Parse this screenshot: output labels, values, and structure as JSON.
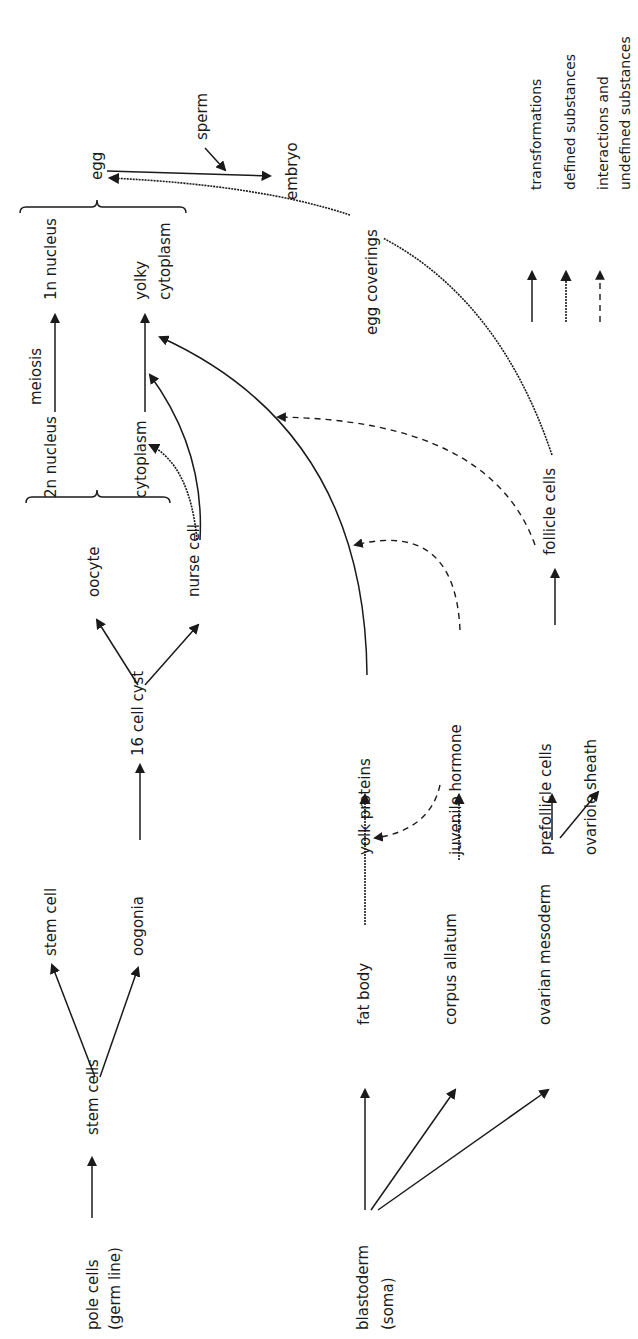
{
  "diagram": {
    "title_orientation": "rotated-90-ccw",
    "colors": {
      "ink": "#1a1a1a",
      "background": "#ffffff"
    },
    "nodes": [
      {
        "id": "pole_cells",
        "label": "pole cells",
        "x": 98,
        "y": 1330
      },
      {
        "id": "germ_line",
        "label": "(germ line)",
        "x": 120,
        "y": 1330
      },
      {
        "id": "stem_cells",
        "label": "stem cells",
        "x": 98,
        "y": 1135
      },
      {
        "id": "stem_cell",
        "label": "stem cell",
        "x": 56,
        "y": 956
      },
      {
        "id": "oogonia",
        "label": "oogonia",
        "x": 143,
        "y": 956
      },
      {
        "id": "cyst16",
        "label": "16 cell cyst",
        "x": 143,
        "y": 756
      },
      {
        "id": "oocyte",
        "label": "oocyte",
        "x": 99,
        "y": 597
      },
      {
        "id": "nurse_cell",
        "label": "nurse cell",
        "x": 199,
        "y": 597
      },
      {
        "id": "n2",
        "label": "2n nucleus",
        "x": 56,
        "y": 498
      },
      {
        "id": "cytoplasm",
        "label": "cytoplasm",
        "x": 146,
        "y": 498
      },
      {
        "id": "meiosis",
        "label": "meiosis",
        "x": 41,
        "y": 405
      },
      {
        "id": "n1",
        "label": "1n nucleus",
        "x": 56,
        "y": 300
      },
      {
        "id": "yolky",
        "label": "yolky",
        "x": 146,
        "y": 300
      },
      {
        "id": "yolky_cyto",
        "label": "cytoplasm",
        "x": 170,
        "y": 300
      },
      {
        "id": "egg",
        "label": "egg",
        "x": 102,
        "y": 180
      },
      {
        "id": "sperm",
        "label": "sperm",
        "x": 207,
        "y": 140
      },
      {
        "id": "embryo",
        "label": "embryo",
        "x": 297,
        "y": 200
      },
      {
        "id": "blastoderm",
        "label": "blastoderm",
        "x": 368,
        "y": 1330
      },
      {
        "id": "soma",
        "label": "(soma)",
        "x": 393,
        "y": 1330
      },
      {
        "id": "fat_body",
        "label": "fat body",
        "x": 369,
        "y": 1025
      },
      {
        "id": "corpus_allatum",
        "label": "corpus allatum",
        "x": 456,
        "y": 1025
      },
      {
        "id": "ovarian_mesoderm",
        "label": "ovarian mesoderm",
        "x": 550,
        "y": 1025
      },
      {
        "id": "yolk_proteins",
        "label": "yolk proteins",
        "x": 370,
        "y": 855
      },
      {
        "id": "juvenile_hormone",
        "label": "juvenile hormone",
        "x": 461,
        "y": 855
      },
      {
        "id": "prefollicle",
        "label": "prefollicle cells",
        "x": 551,
        "y": 855
      },
      {
        "id": "ovariole_sheath",
        "label": "ovariole sheath",
        "x": 596,
        "y": 855
      },
      {
        "id": "follicle",
        "label": "follicle cells",
        "x": 555,
        "y": 555
      },
      {
        "id": "egg_coverings",
        "label": "egg coverings",
        "x": 377,
        "y": 335
      }
    ],
    "legend": [
      {
        "type": "transformations",
        "label": "transformations",
        "x": 541,
        "y": 190
      },
      {
        "type": "defined",
        "label": "defined substances",
        "x": 575,
        "y": 190
      },
      {
        "type": "interactions",
        "label": "interactions and",
        "x": 608,
        "y": 190
      },
      {
        "type": "interactions2",
        "label": "undefined substances",
        "x": 630,
        "y": 190
      }
    ]
  }
}
